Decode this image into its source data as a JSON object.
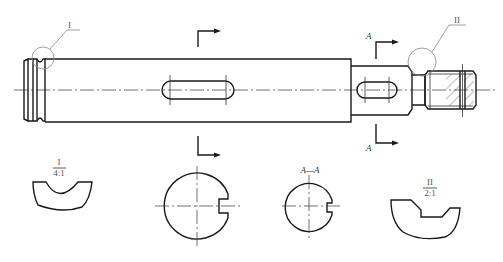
{
  "drawing": {
    "type": "shaft-technical-drawing",
    "detail_labels": {
      "detail_1": {
        "mark": "I",
        "scale": "4:1"
      },
      "detail_2": {
        "mark": "II",
        "scale": "2:1"
      }
    },
    "section_labels": {
      "section_a_top": "A",
      "section_a_bottom": "A",
      "section_a_view": "A—A"
    },
    "views": [
      "main-view-shaft",
      "detail-I-groove",
      "section-keyway-middle",
      "section-A-A",
      "detail-II-undercut"
    ]
  }
}
